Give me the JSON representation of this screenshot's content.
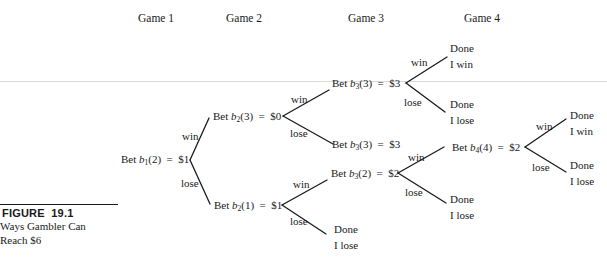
{
  "headers": {
    "game1": "Game 1",
    "game2": "Game 2",
    "game3": "Game 3",
    "game4": "Game 4"
  },
  "caption": {
    "figure": "FIGURE  19.1",
    "line1": "Ways Gambler Can",
    "line2": "Reach $6"
  },
  "nodes": {
    "b1_2": {
      "pre": "Bet ",
      "var": "b",
      "sub": "1",
      "arg": "(2)",
      "val": "  =  $1"
    },
    "b2_3": {
      "pre": "Bet ",
      "var": "b",
      "sub": "2",
      "arg": "(3)",
      "val": "  =  $0"
    },
    "b2_1": {
      "pre": "Bet ",
      "var": "b",
      "sub": "2",
      "arg": "(1)",
      "val": "  =  $1"
    },
    "b3_3_top": {
      "pre": "Bet ",
      "var": "b",
      "sub": "3",
      "arg": "(3)",
      "val": "  =  $3"
    },
    "b3_3_mid": {
      "pre": "Bet ",
      "var": "b",
      "sub": "3",
      "arg": "(3)",
      "val": "  =  $3"
    },
    "b3_2": {
      "pre": "Bet ",
      "var": "b",
      "sub": "3",
      "arg": "(2)",
      "val": "  =  $2"
    },
    "b4_4": {
      "pre": "Bet ",
      "var": "b",
      "sub": "4",
      "arg": "(4)",
      "val": "  =  $2"
    }
  },
  "outcomes": {
    "top_win": {
      "l1": "Done",
      "l2": "I win"
    },
    "top_lose": {
      "l1": "Done",
      "l2": "I lose"
    },
    "b3_2_lose": {
      "l1": "Done",
      "l2": "I lose"
    },
    "b2_1_lose": {
      "l1": "Done",
      "l2": "I lose"
    },
    "b4_win": {
      "l1": "Done",
      "l2": "I win"
    },
    "b4_lose": {
      "l1": "Done",
      "l2": "I lose"
    }
  },
  "edges": {
    "win": "win",
    "lose": "lose"
  }
}
